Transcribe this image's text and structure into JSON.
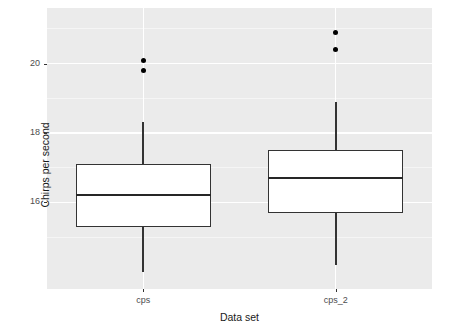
{
  "chart_data": {
    "type": "boxplot",
    "title": "",
    "xlabel": "Data set",
    "ylabel": "Chirps per second",
    "categories": [
      "cps",
      "cps_2"
    ],
    "ylim": [
      13.5,
      21.6
    ],
    "yticks": [
      16,
      18,
      20
    ],
    "ytick_labels": [
      "16",
      "18",
      "20"
    ],
    "grid": true,
    "legend": "none",
    "panel_background": "#ebebeb",
    "gridline_color": "#ffffff",
    "box_fill": "#ffffff",
    "box_stroke": "#333333",
    "outlier_color": "#000000",
    "boxes": [
      {
        "name": "cps",
        "whisker_low": 14.0,
        "q1": 15.3,
        "median": 16.2,
        "q3": 17.1,
        "whisker_high": 18.3,
        "outliers": [
          20.1,
          19.8
        ]
      },
      {
        "name": "cps_2",
        "whisker_low": 14.2,
        "q1": 15.7,
        "median": 16.7,
        "q3": 17.5,
        "whisker_high": 18.9,
        "outliers": [
          20.9,
          20.4
        ]
      }
    ]
  },
  "axis": {
    "y_title": "Chirps per second",
    "x_title": "Data set",
    "y_tick_labels": [
      "20",
      "18",
      "16"
    ],
    "x_tick_labels": [
      "cps",
      "cps_2"
    ]
  }
}
